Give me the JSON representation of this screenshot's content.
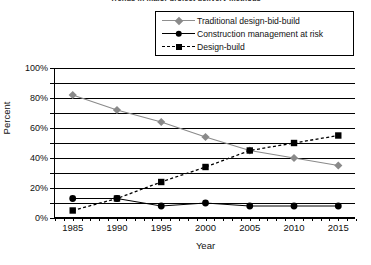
{
  "chart_data": {
    "type": "line",
    "title": "Trends in major project delivery methods",
    "xlabel": "Year",
    "ylabel": "Percent",
    "x": [
      1985,
      1990,
      1995,
      2000,
      2005,
      2010,
      2015
    ],
    "xtick_labels": [
      "1985",
      "1990",
      "1995",
      "2000",
      "2005",
      "2010",
      "2015"
    ],
    "xlim": [
      1983,
      2017
    ],
    "ylim": [
      0,
      100
    ],
    "ytick_labels": [
      "0%",
      "20%",
      "40%",
      "60%",
      "80%",
      "100%"
    ],
    "ytick_values": [
      0,
      20,
      40,
      60,
      80,
      100
    ],
    "gridlines": [
      0,
      10,
      20,
      30,
      40,
      50,
      60,
      70,
      80,
      90,
      100
    ],
    "grid": true,
    "legend_position": "top-right",
    "series": [
      {
        "name": "Traditional design-bid-build",
        "values": [
          82,
          72,
          64,
          54,
          45,
          40,
          35
        ],
        "color": "#8a8a8a",
        "marker": "diamond",
        "line_style": "solid"
      },
      {
        "name": "Construction management at risk",
        "values": [
          13,
          13,
          8,
          10,
          8,
          8,
          8
        ],
        "color": "#000000",
        "marker": "circle",
        "line_style": "solid"
      },
      {
        "name": "Design-build",
        "values": [
          5,
          13,
          24,
          34,
          45,
          50,
          55
        ],
        "color": "#000000",
        "marker": "square",
        "line_style": "dashed"
      }
    ]
  },
  "legend": {
    "items": [
      {
        "label": "Traditional design-bid-build"
      },
      {
        "label": "Construction management at risk"
      },
      {
        "label": "Design-build"
      }
    ]
  }
}
